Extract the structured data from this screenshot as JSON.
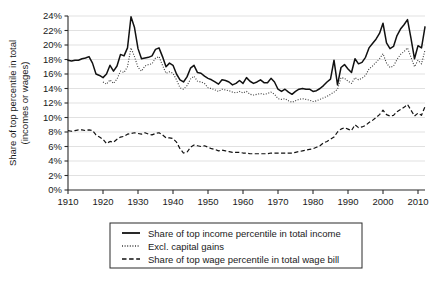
{
  "chart_data": {
    "type": "line",
    "title": "",
    "xlabel": "",
    "ylabel": "Share of top percentile in total (incomes or wages)",
    "ylabel_line1": "Share of top percentile in total",
    "ylabel_line2": "(incomes or wages)",
    "xlim": [
      1910,
      2012
    ],
    "ylim": [
      0,
      24
    ],
    "grid": "horizontal",
    "legend_position": "bottom-center",
    "ytick_labels": [
      "0%",
      "2%",
      "4%",
      "6%",
      "8%",
      "10%",
      "12%",
      "14%",
      "16%",
      "18%",
      "20%",
      "22%",
      "24%"
    ],
    "ytick_values": [
      0,
      2,
      4,
      6,
      8,
      10,
      12,
      14,
      16,
      18,
      20,
      22,
      24
    ],
    "xtick_labels": [
      "1910",
      "1920",
      "1930",
      "1940",
      "1950",
      "1960",
      "1970",
      "1980",
      "1990",
      "2000",
      "2010"
    ],
    "xtick_values": [
      1910,
      1920,
      1930,
      1940,
      1950,
      1960,
      1970,
      1980,
      1990,
      2000,
      2010
    ],
    "x": [
      1910,
      1911,
      1912,
      1913,
      1914,
      1915,
      1916,
      1917,
      1918,
      1919,
      1920,
      1921,
      1922,
      1923,
      1924,
      1925,
      1926,
      1927,
      1928,
      1929,
      1930,
      1931,
      1932,
      1933,
      1934,
      1935,
      1936,
      1937,
      1938,
      1939,
      1940,
      1941,
      1942,
      1943,
      1944,
      1945,
      1946,
      1947,
      1948,
      1949,
      1950,
      1951,
      1952,
      1953,
      1954,
      1955,
      1956,
      1957,
      1958,
      1959,
      1960,
      1961,
      1962,
      1963,
      1964,
      1965,
      1966,
      1967,
      1968,
      1969,
      1970,
      1971,
      1972,
      1973,
      1974,
      1975,
      1976,
      1977,
      1978,
      1979,
      1980,
      1981,
      1982,
      1983,
      1984,
      1985,
      1986,
      1987,
      1988,
      1989,
      1990,
      1991,
      1992,
      1993,
      1994,
      1995,
      1996,
      1997,
      1998,
      1999,
      2000,
      2001,
      2002,
      2003,
      2004,
      2005,
      2006,
      2007,
      2008,
      2009,
      2010,
      2011,
      2012
    ],
    "series": [
      {
        "name": "Share of top income percentile in total income",
        "style": "solid",
        "color": "#111111",
        "values": [
          17.9,
          17.8,
          17.9,
          17.9,
          18.1,
          18.2,
          18.4,
          17.5,
          16.0,
          15.8,
          15.5,
          16.0,
          17.2,
          16.4,
          17.1,
          18.7,
          18.5,
          19.6,
          23.9,
          22.4,
          19.5,
          18.1,
          18.2,
          18.3,
          18.5,
          19.4,
          19.6,
          18.4,
          17.0,
          17.5,
          17.2,
          16.0,
          15.2,
          14.9,
          15.6,
          16.8,
          17.2,
          16.2,
          16.1,
          15.7,
          15.4,
          15.2,
          14.9,
          14.6,
          15.2,
          15.1,
          14.9,
          14.5,
          14.7,
          15.1,
          14.7,
          15.5,
          15.0,
          14.7,
          14.9,
          15.2,
          14.8,
          14.8,
          15.4,
          14.9,
          13.9,
          13.6,
          13.9,
          13.5,
          13.2,
          13.6,
          13.9,
          14.0,
          13.9,
          13.9,
          13.6,
          13.7,
          14.0,
          14.4,
          14.9,
          15.3,
          17.9,
          14.5,
          16.9,
          17.3,
          16.7,
          16.2,
          18.1,
          17.4,
          17.6,
          18.3,
          19.6,
          20.2,
          20.8,
          21.6,
          23.0,
          20.3,
          19.5,
          19.8,
          21.3,
          22.2,
          22.8,
          23.5,
          20.9,
          18.1,
          19.9,
          19.6,
          22.5
        ]
      },
      {
        "name": "Excl. capital gains",
        "style": "dotted",
        "color": "#3a3a3a",
        "values": [
          null,
          null,
          null,
          null,
          null,
          null,
          null,
          null,
          null,
          null,
          14.9,
          14.6,
          15.2,
          14.7,
          15.3,
          16.4,
          16.2,
          17.0,
          19.6,
          18.4,
          16.9,
          16.4,
          17.1,
          17.3,
          17.4,
          18.2,
          18.4,
          17.2,
          16.1,
          16.3,
          16.1,
          15.2,
          14.1,
          13.9,
          14.4,
          15.3,
          15.7,
          15.0,
          14.9,
          14.7,
          14.1,
          14.0,
          13.8,
          13.6,
          13.9,
          13.8,
          13.7,
          13.5,
          13.4,
          13.6,
          13.4,
          13.6,
          13.2,
          13.1,
          13.2,
          13.3,
          13.2,
          13.3,
          13.5,
          13.2,
          12.6,
          12.5,
          12.6,
          12.3,
          12.1,
          12.3,
          12.5,
          12.6,
          12.5,
          12.4,
          12.2,
          12.3,
          12.5,
          12.7,
          12.9,
          13.2,
          13.5,
          13.9,
          15.5,
          15.4,
          15.0,
          14.7,
          15.5,
          15.2,
          15.4,
          15.8,
          16.7,
          17.1,
          17.6,
          18.1,
          18.8,
          17.5,
          16.9,
          17.1,
          18.0,
          18.7,
          19.1,
          19.6,
          18.3,
          17.0,
          17.9,
          17.4,
          19.3
        ]
      },
      {
        "name": "Share of top wage percentile in total wage bill",
        "style": "dashed",
        "color": "#111111",
        "values": [
          8.2,
          8.1,
          8.2,
          8.3,
          8.3,
          8.2,
          8.3,
          8.2,
          7.6,
          7.3,
          7.0,
          6.4,
          6.7,
          6.6,
          7.0,
          7.3,
          7.4,
          7.7,
          7.8,
          7.9,
          7.8,
          7.7,
          7.9,
          7.7,
          7.6,
          7.8,
          7.9,
          7.6,
          7.2,
          7.2,
          7.1,
          6.6,
          5.7,
          5.1,
          5.2,
          5.9,
          6.2,
          6.1,
          6.0,
          6.1,
          5.9,
          5.7,
          5.6,
          5.4,
          5.5,
          5.4,
          5.3,
          5.2,
          5.2,
          5.2,
          5.1,
          5.1,
          5.0,
          5.0,
          5.0,
          5.0,
          5.0,
          5.0,
          5.1,
          5.1,
          5.1,
          5.1,
          5.1,
          5.1,
          5.1,
          5.2,
          5.3,
          5.4,
          5.5,
          5.6,
          5.7,
          5.9,
          6.1,
          6.5,
          6.7,
          7.0,
          7.3,
          8.0,
          8.4,
          8.6,
          8.4,
          8.2,
          9.0,
          8.6,
          8.7,
          8.9,
          9.3,
          9.6,
          10.0,
          10.4,
          11.0,
          10.4,
          10.2,
          10.3,
          10.8,
          11.1,
          11.4,
          11.8,
          11.0,
          10.2,
          10.6,
          10.3,
          11.5
        ]
      }
    ]
  },
  "legend": {
    "entries": [
      {
        "label": "Share of top income percentile in total income",
        "marker": "solid-line-marker"
      },
      {
        "label": "Excl. capital gains",
        "marker": "dotted-line-marker"
      },
      {
        "label": "Share of top wage percentile in total wage bill",
        "marker": "dashed-line-marker"
      }
    ]
  }
}
